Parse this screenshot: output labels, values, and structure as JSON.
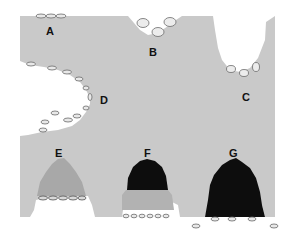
{
  "figure": {
    "colors": {
      "background": "#ffffff",
      "tissue": "#c9c9c9",
      "light_mass": "#a9a9a9",
      "dark_mass": "#0d0d0d",
      "cell_outline": "#6b6b6b",
      "cell_fill": "#e8e8e8"
    },
    "labels": [
      {
        "id": "A",
        "text": "A",
        "x": 50,
        "y": 31
      },
      {
        "id": "B",
        "text": "B",
        "x": 153,
        "y": 52
      },
      {
        "id": "C",
        "text": "C",
        "x": 246,
        "y": 97
      },
      {
        "id": "D",
        "text": "D",
        "x": 104,
        "y": 100
      },
      {
        "id": "E",
        "text": "E",
        "x": 59,
        "y": 153
      },
      {
        "id": "F",
        "text": "F",
        "x": 147,
        "y": 153
      },
      {
        "id": "G",
        "text": "G",
        "x": 233,
        "y": 153
      }
    ],
    "regions": [
      {
        "id": "A",
        "type": "flat-surface-cells",
        "cell_count": 3
      },
      {
        "id": "B",
        "type": "notch-cells",
        "cell_count": 3
      },
      {
        "id": "C",
        "type": "deep-crypt-cells",
        "cell_count": 3
      },
      {
        "id": "D",
        "type": "lateral-cleft-cells",
        "cell_count": 12
      },
      {
        "id": "E",
        "type": "light-mass",
        "cell_count": 5
      },
      {
        "id": "F",
        "type": "dark-over-light-mass",
        "cell_count": 6
      },
      {
        "id": "G",
        "type": "dark-mass",
        "cell_count": 5
      }
    ]
  }
}
